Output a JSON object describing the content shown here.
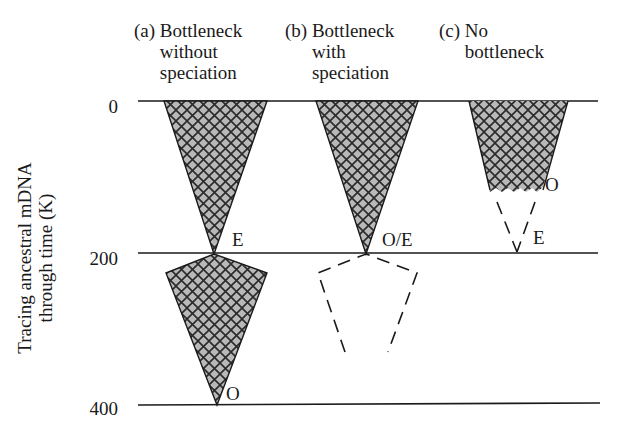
{
  "panels": [
    {
      "tag": "(a)",
      "title_lines": [
        "Bottleneck",
        "without",
        "speciation"
      ],
      "labels": {
        "upper_apex": "E",
        "lower_apex": "O"
      }
    },
    {
      "tag": "(b)",
      "title_lines": [
        "Bottleneck",
        "with",
        "speciation"
      ],
      "labels": {
        "upper_apex": "O/E"
      }
    },
    {
      "tag": "(c)",
      "title_lines": [
        "No",
        "bottleneck"
      ],
      "labels": {
        "mid": "O",
        "apex": "E"
      }
    }
  ],
  "y_axis": {
    "label_lines": [
      "Tracing ancestral mDNA",
      "through time (K)"
    ],
    "ticks": [
      "0",
      "200",
      "400"
    ]
  },
  "colors": {
    "fill": "#b8b8b8",
    "hatch": "#2a2a2a",
    "line": "#1a1a1a",
    "background": "#ffffff"
  }
}
